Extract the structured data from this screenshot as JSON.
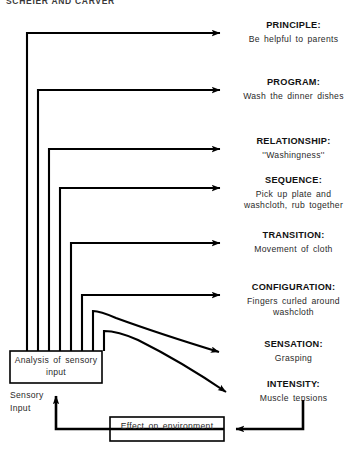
{
  "header": {
    "running_head": "SCHEIER AND CARVER"
  },
  "diagram": {
    "type": "hierarchical-control-diagram",
    "line_color": "#000000",
    "box_fill": "#ffffff",
    "levels": [
      {
        "title": "PRINCIPLE:",
        "description": "Be helpful to parents"
      },
      {
        "title": "PROGRAM:",
        "description": "Wash the dinner dishes"
      },
      {
        "title": "RELATIONSHIP:",
        "description": "''Washingness''"
      },
      {
        "title": "SEQUENCE:",
        "description": "Pick up plate and washcloth, rub together"
      },
      {
        "title": "TRANSITION:",
        "description": "Movement of cloth"
      },
      {
        "title": "CONFIGURATION:",
        "description": "Fingers curled around washcloth"
      },
      {
        "title": "SENSATION:",
        "description": "Grasping"
      },
      {
        "title": "INTENSITY:",
        "description": "Muscle tensions"
      }
    ],
    "boxes": [
      {
        "name": "analysis-box",
        "label": "Analysis of sensory input"
      },
      {
        "name": "effect-box",
        "label": "Effect on environment"
      }
    ],
    "annotations": [
      {
        "name": "sensory-input-label",
        "label": "Sensory Input"
      }
    ]
  }
}
